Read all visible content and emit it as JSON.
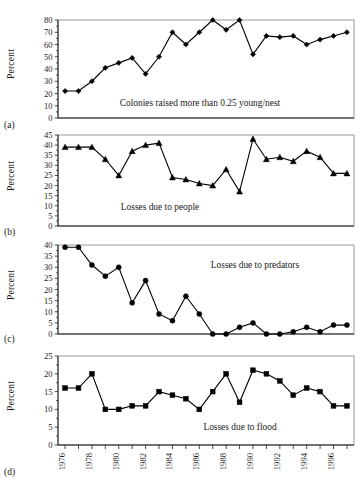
{
  "figure": {
    "ylabel": "Percent",
    "panel_labels": [
      "(a)",
      "(b)",
      "(c)",
      "(d)"
    ],
    "xtick_labels": [
      "1976",
      "1978",
      "1980",
      "1982",
      "1984",
      "1986",
      "1988",
      "1990",
      "1992",
      "1994",
      "1996"
    ],
    "line_color": "#000000",
    "frame_color": "#999999",
    "text_color": "#1a1a1a",
    "background": "#ffffff"
  },
  "chart_data": [
    {
      "type": "line",
      "panel": "(a)",
      "title": "Colonies raised more than 0.25 young/nest",
      "annotation": "Colonies raised more than 0.25 young/nest",
      "xlabel": "",
      "ylabel": "Percent",
      "marker": "diamond",
      "grid": false,
      "legend": "none",
      "ylim": [
        0,
        80
      ],
      "yticks": [
        0,
        10,
        20,
        30,
        40,
        50,
        60,
        70,
        80
      ],
      "x": [
        1976,
        1977,
        1978,
        1979,
        1980,
        1981,
        1982,
        1983,
        1984,
        1985,
        1986,
        1987,
        1988,
        1989,
        1990,
        1991,
        1992,
        1993,
        1994,
        1995,
        1996,
        1997
      ],
      "values": [
        22,
        22,
        30,
        41,
        45,
        49,
        36,
        50,
        70,
        60,
        70,
        80,
        72,
        80,
        52,
        67,
        66,
        67,
        60,
        64,
        67,
        70
      ]
    },
    {
      "type": "line",
      "panel": "(b)",
      "title": "Losses due to people",
      "annotation": "Losses due to people",
      "xlabel": "",
      "ylabel": "Percent",
      "marker": "triangle",
      "grid": false,
      "legend": "none",
      "ylim": [
        0,
        45
      ],
      "yticks": [
        0,
        5,
        10,
        15,
        20,
        25,
        30,
        35,
        40,
        45
      ],
      "x": [
        1976,
        1977,
        1978,
        1979,
        1980,
        1981,
        1982,
        1983,
        1984,
        1985,
        1986,
        1987,
        1988,
        1989,
        1990,
        1991,
        1992,
        1993,
        1994,
        1995,
        1996,
        1997
      ],
      "values": [
        39,
        39,
        39,
        33,
        25,
        37,
        40,
        41,
        24,
        23,
        21,
        20,
        28,
        17,
        43,
        33,
        34,
        32,
        37,
        34,
        26,
        26
      ]
    },
    {
      "type": "line",
      "panel": "(c)",
      "title": "Losses due to predators",
      "annotation": "Losses due to predators",
      "xlabel": "",
      "ylabel": "Percent",
      "marker": "circle",
      "grid": false,
      "legend": "none",
      "ylim": [
        0,
        40
      ],
      "yticks": [
        0,
        5,
        10,
        15,
        20,
        25,
        30,
        35,
        40
      ],
      "x": [
        1976,
        1977,
        1978,
        1979,
        1980,
        1981,
        1982,
        1983,
        1984,
        1985,
        1986,
        1987,
        1988,
        1989,
        1990,
        1991,
        1992,
        1993,
        1994,
        1995,
        1996,
        1997
      ],
      "values": [
        39,
        39,
        31,
        26,
        30,
        14,
        24,
        9,
        6,
        17,
        9,
        0,
        0,
        3,
        5,
        0,
        0,
        1,
        3,
        1,
        4,
        4
      ]
    },
    {
      "type": "line",
      "panel": "(d)",
      "title": "Losses due to flood",
      "annotation": "Losses due to flood",
      "xlabel": "",
      "ylabel": "Percent",
      "marker": "square",
      "grid": false,
      "legend": "none",
      "ylim": [
        0,
        25
      ],
      "yticks": [
        0,
        5,
        10,
        15,
        20,
        25
      ],
      "x": [
        1976,
        1977,
        1978,
        1979,
        1980,
        1981,
        1982,
        1983,
        1984,
        1985,
        1986,
        1987,
        1988,
        1989,
        1990,
        1991,
        1992,
        1993,
        1994,
        1995,
        1996,
        1997
      ],
      "values": [
        16,
        16,
        20,
        10,
        10,
        11,
        11,
        15,
        14,
        13,
        10,
        15,
        20,
        12,
        21,
        20,
        18,
        14,
        16,
        15,
        11,
        11
      ]
    }
  ]
}
